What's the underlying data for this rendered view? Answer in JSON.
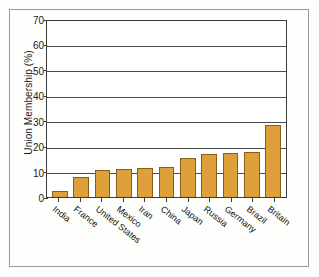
{
  "chart_data": {
    "type": "bar",
    "title": "",
    "xlabel": "",
    "ylabel": "Union Membership (%)",
    "ylim": [
      0,
      70
    ],
    "yticks": [
      0,
      10,
      20,
      30,
      40,
      50,
      60,
      70
    ],
    "grid": true,
    "legend": "none",
    "orientation": "vertical",
    "bar_color": "#dda03b",
    "bar_edge_color": "#8a5e16",
    "categories": [
      "India",
      "France",
      "United States",
      "Mexico",
      "Iran",
      "China",
      "Japan",
      "Russia",
      "Germany",
      "Brazil",
      "Britain"
    ],
    "values": [
      2.2,
      7.7,
      10.5,
      11.0,
      11.5,
      11.8,
      15.2,
      16.8,
      17.3,
      17.6,
      28.5
    ]
  }
}
